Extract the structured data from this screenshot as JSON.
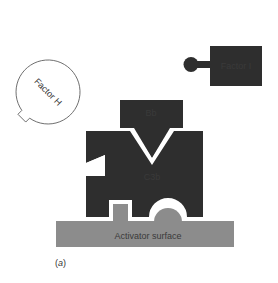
{
  "figure": {
    "panel_label_open": "(",
    "panel_label_letter": "a",
    "panel_label_close": ")"
  },
  "components": {
    "factor_i": {
      "label": "Factor I",
      "color": "#2e2e2e"
    },
    "factor_h": {
      "label": "Factor H",
      "color": "#ffffff",
      "stroke": "#555555"
    },
    "bb": {
      "label": "Bb",
      "color": "#2e2e2e"
    },
    "c3b": {
      "label": "C3b",
      "color": "#2e2e2e"
    },
    "activator_surface": {
      "label": "Activator surface",
      "color": "#8c8c8c"
    }
  },
  "colors": {
    "background": "#ffffff",
    "dark_protein": "#2e2e2e",
    "surface": "#8c8c8c",
    "outline": "#555555"
  }
}
